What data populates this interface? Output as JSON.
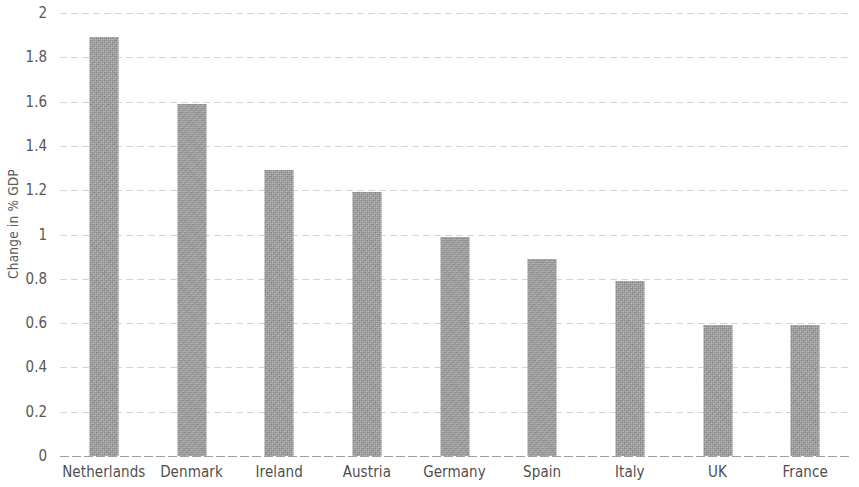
{
  "chart_data": {
    "type": "bar",
    "title": "",
    "subtitle": "",
    "xlabel": "",
    "ylabel": "Change in % GDP",
    "categories": [
      "Netherlands",
      "Denmark",
      "Ireland",
      "Austria",
      "Germany",
      "Spain",
      "Italy",
      "UK",
      "France"
    ],
    "values": [
      1.89,
      1.59,
      1.29,
      1.19,
      0.99,
      0.89,
      0.79,
      0.59,
      0.59
    ],
    "ylim": [
      0,
      2
    ],
    "ytick_labels": [
      "0",
      "0.2",
      "0.4",
      "0.6",
      "0.8",
      "1",
      "1.2",
      "1.4",
      "1.6",
      "1.8",
      "2"
    ],
    "ytick_values": [
      0,
      0.2,
      0.4,
      0.6,
      0.8,
      1,
      1.2,
      1.4,
      1.6,
      1.8,
      2
    ],
    "grid": true,
    "grid_axis": "y",
    "grid_style": "dotted",
    "legend": false,
    "legend_position": "none",
    "bar_color": "#9a9a9a",
    "text_color": "#555555",
    "background_color": "#ffffff"
  }
}
